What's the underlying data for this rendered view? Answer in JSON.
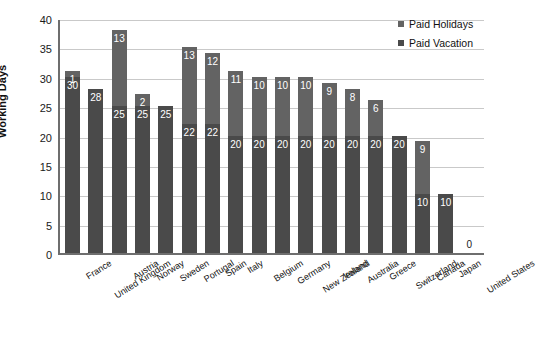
{
  "chart_data": {
    "type": "bar",
    "subtype": "stacked-bar",
    "title": "",
    "xlabel": "",
    "ylabel": "Working Days",
    "ylim": [
      0,
      40
    ],
    "ytick_step": 5,
    "yticks": [
      0,
      5,
      10,
      15,
      20,
      25,
      30,
      35,
      40
    ],
    "grid": true,
    "legend_position": "top-right",
    "categories": [
      "France",
      "United Kingdom",
      "Austria",
      "Norway",
      "Sweden",
      "Portugal",
      "Spain",
      "Italy",
      "Belgium",
      "Germany",
      "New Zealand",
      "Ireland",
      "Australia",
      "Greece",
      "Switzerland",
      "Canada",
      "Japan",
      "United States"
    ],
    "series": [
      {
        "name": "Paid Vacation",
        "color": "#4a4a4a",
        "values": [
          30,
          28,
          25,
          25,
          25,
          22,
          22,
          20,
          20,
          20,
          20,
          20,
          20,
          20,
          20,
          10,
          10,
          0
        ],
        "labels": [
          "30",
          "28",
          "25",
          "25",
          "25",
          "22",
          "22",
          "20",
          "20",
          "20",
          "20",
          "20",
          "20",
          "20",
          "20",
          "10",
          "10",
          ""
        ]
      },
      {
        "name": "Paid Holidays",
        "color": "#636363",
        "values": [
          1,
          0,
          13,
          2,
          0,
          13,
          12,
          11,
          10,
          10,
          10,
          9,
          8,
          6,
          0,
          9,
          0,
          0
        ],
        "labels": [
          "1",
          "",
          "13",
          "2",
          "",
          "13",
          "12",
          "11",
          "10",
          "10",
          "10",
          "9",
          "8",
          "6",
          "",
          "9",
          "",
          ""
        ]
      }
    ],
    "totals": [
      31,
      28,
      38,
      27,
      25,
      35,
      34,
      31,
      30,
      30,
      30,
      29,
      28,
      26,
      20,
      19,
      10,
      0
    ],
    "zero_value_label": "0",
    "zero_value_category": "United States"
  },
  "legend": {
    "entries": [
      {
        "label": "Paid Holidays",
        "color": "#636363"
      },
      {
        "label": "Paid Vacation",
        "color": "#4a4a4a"
      }
    ]
  },
  "axis": {
    "y_title": "Working Days",
    "y_labels": [
      "40",
      "35",
      "30",
      "25",
      "20",
      "15",
      "10",
      "5",
      "0"
    ]
  },
  "colors": {
    "paid_vacation": "#4a4a4a",
    "paid_holidays": "#636363",
    "gridline": "#c9c9c9",
    "axis": "#6e6e6e",
    "background": "#ffffff",
    "text": "#111111",
    "bar_label_text": "#ffffff"
  }
}
